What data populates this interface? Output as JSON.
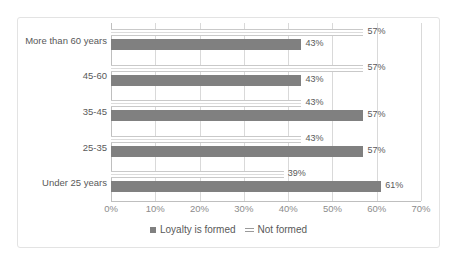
{
  "chart_data": {
    "type": "bar",
    "orientation": "horizontal",
    "title": "",
    "xlabel": "",
    "ylabel": "",
    "xlim": [
      0,
      70
    ],
    "xticks": [
      "0%",
      "10%",
      "20%",
      "30%",
      "40%",
      "50%",
      "60%",
      "70%"
    ],
    "xtick_values": [
      0,
      10,
      20,
      30,
      40,
      50,
      60,
      70
    ],
    "grid": "vertical",
    "legend_position": "bottom",
    "categories": [
      "Under 25 years",
      "25-35",
      "35-45",
      "45-60",
      "More than 60 years"
    ],
    "series": [
      {
        "name": "Loyalty is formed",
        "style": "solid",
        "color": "#808080",
        "values": [
          61,
          57,
          57,
          43,
          43
        ],
        "labels": [
          "61%",
          "57%",
          "57%",
          "43%",
          "43%"
        ]
      },
      {
        "name": "Not formed",
        "style": "outline",
        "color": "#c9c9c9",
        "values": [
          39,
          43,
          43,
          57,
          57
        ],
        "labels": [
          "39%",
          "43%",
          "43%",
          "57%",
          "57%"
        ]
      }
    ]
  },
  "legend": {
    "entries": [
      {
        "label": "Loyalty is formed",
        "marker": "solid-square-icon"
      },
      {
        "label": "Not formed",
        "marker": "double-line-icon"
      }
    ]
  }
}
